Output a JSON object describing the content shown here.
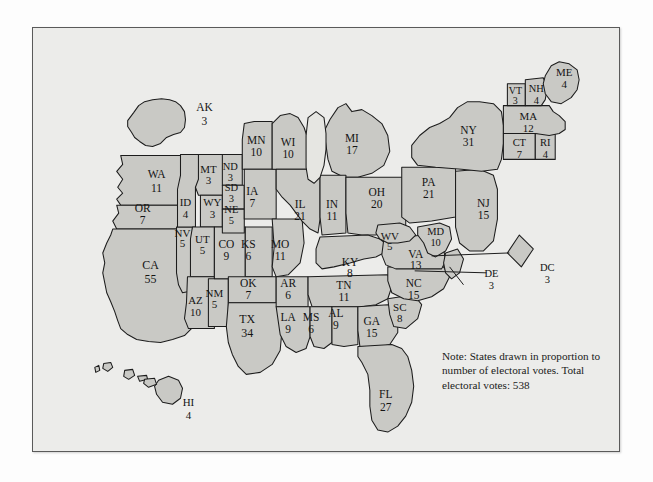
{
  "figure": {
    "kind": "electoral-vote-cartogram",
    "note": "Note: States drawn in proportion to number of electoral votes.  Total electoral votes: 538",
    "colors": {
      "page_background": "#fdfdfd",
      "frame_background": "#ececea",
      "frame_border": "#5a5a5a",
      "state_fill": "#c9c9c5",
      "state_stroke": "#1c1c1c",
      "lake_fill": "#e6e6e2",
      "text": "#141414"
    }
  },
  "chart_data": {
    "type": "map",
    "title": "",
    "subtitle": "",
    "xlabel": "",
    "ylabel": "",
    "annotations": [
      "Note: States drawn in proportion to number of electoral votes.  Total electoral votes: 538"
    ],
    "legend": [],
    "total_label": "Total electoral votes: 538",
    "total_value": 538,
    "value_name": "electoral votes",
    "categories": [
      "AK",
      "WA",
      "OR",
      "CA",
      "NV",
      "ID",
      "MT",
      "WY",
      "UT",
      "AZ",
      "NM",
      "CO",
      "ND",
      "SD",
      "NE",
      "KS",
      "OK",
      "TX",
      "MN",
      "IA",
      "MO",
      "AR",
      "LA",
      "WI",
      "IL",
      "MI",
      "IN",
      "OH",
      "KY",
      "TN",
      "MS",
      "AL",
      "GA",
      "FL",
      "SC",
      "NC",
      "VA",
      "WV",
      "MD",
      "DE",
      "DC",
      "PA",
      "NJ",
      "NY",
      "CT",
      "RI",
      "MA",
      "VT",
      "NH",
      "ME",
      "HI"
    ],
    "values": [
      3,
      11,
      7,
      55,
      5,
      4,
      3,
      3,
      5,
      10,
      5,
      9,
      3,
      3,
      5,
      6,
      7,
      34,
      10,
      7,
      11,
      6,
      9,
      10,
      21,
      17,
      11,
      20,
      8,
      11,
      6,
      9,
      15,
      27,
      8,
      15,
      13,
      5,
      10,
      3,
      3,
      21,
      15,
      31,
      7,
      4,
      12,
      3,
      4,
      4,
      4
    ]
  },
  "states": [
    {
      "id": "AK",
      "abbr": "AK",
      "votes": "3",
      "lx": 172,
      "ly": 81,
      "vy": 95,
      "fs": 11.5,
      "d": "M 95 93 L 101 85 L 106 78 L 112 74 L 120 72 L 129 71 L 137 72 L 143 74 L 148 78 L 152 84 L 153 92 L 152 100 L 148 105 L 141 107 L 134 110 L 128 116 L 120 119 L 113 118 L 107 114 L 102 110 L 99 105 L 95 99 Z"
    },
    {
      "id": "WA",
      "abbr": "WA",
      "votes": "11",
      "lx": 124,
      "ly": 148,
      "vy": 162,
      "fs": 11.5,
      "d": "M 88 128 L 161 128 L 161 178 L 88 178 L 84 172 L 90 166 L 85 160 L 90 152 L 84 144 L 90 137 Z"
    },
    {
      "id": "OR",
      "abbr": "OR",
      "votes": "7",
      "lx": 110,
      "ly": 182,
      "vy": 194,
      "fs": 11.5,
      "d": "M 84 178 L 161 178 L 161 202 L 84 202 L 80 194 L 86 186 Z"
    },
    {
      "id": "CA",
      "abbr": "CA",
      "votes": "55",
      "lx": 118,
      "ly": 239,
      "vy": 253,
      "fs": 12,
      "d": "M 80 202 L 161 202 L 161 300 L 152 309 L 140 313 L 128 316 L 116 315 L 104 313 L 95 308 L 88 302 L 85 294 L 82 285 L 78 275 L 74 266 L 72 256 L 70 246 L 72 236 L 70 226 L 74 216 L 78 208 Z"
    },
    {
      "id": "NV",
      "abbr": "NV",
      "votes": "5",
      "lx": 150,
      "ly": 207,
      "vy": 218,
      "fs": 11,
      "d": "M 144 200 L 160 200 L 160 264 L 150 266 L 146 258 L 144 246 Z"
    },
    {
      "id": "ID",
      "abbr": "ID",
      "votes": "4",
      "lx": 153,
      "ly": 176,
      "vy": 188,
      "fs": 11,
      "d": "M 148 127 L 168 127 L 168 155 L 163 160 L 163 200 L 145 200 L 145 162 L 148 148 Z"
    },
    {
      "id": "MT",
      "abbr": "MT",
      "votes": "3",
      "lx": 176,
      "ly": 143,
      "vy": 154,
      "fs": 11,
      "d": "M 166 127 L 192 127 L 192 168 L 166 168 L 163 160 L 166 152 Z"
    },
    {
      "id": "WY",
      "abbr": "WY",
      "votes": "3",
      "lx": 180,
      "ly": 176,
      "vy": 188,
      "fs": 11,
      "d": "M 168 168 L 190 168 L 190 200 L 168 200 Z"
    },
    {
      "id": "UT",
      "abbr": "UT",
      "votes": "5",
      "lx": 170,
      "ly": 213,
      "vy": 225,
      "fs": 11,
      "d": "M 160 200 L 182 200 L 182 250 L 158 250 L 158 212 Z"
    },
    {
      "id": "AZ",
      "abbr": "AZ",
      "votes": "10",
      "lx": 163,
      "ly": 275,
      "vy": 287,
      "fs": 11,
      "d": "M 155 250 L 182 250 L 182 302 L 156 302 L 152 292 L 154 276 Z"
    },
    {
      "id": "NM",
      "abbr": "NM",
      "votes": "5",
      "lx": 182,
      "ly": 268,
      "vy": 279,
      "fs": 11,
      "d": "M 176 252 L 196 252 L 196 300 L 176 300 Z"
    },
    {
      "id": "CO",
      "abbr": "CO",
      "votes": "9",
      "lx": 194,
      "ly": 218,
      "vy": 230,
      "fs": 11.5,
      "d": "M 182 200 L 213 200 L 213 252 L 182 252 Z"
    },
    {
      "id": "ND",
      "abbr": "ND",
      "votes": "3",
      "lx": 198,
      "ly": 140,
      "vy": 151,
      "fs": 10.5,
      "d": "M 190 127 L 210 127 L 210 158 L 190 158 Z"
    },
    {
      "id": "SD",
      "abbr": "SD",
      "votes": "3",
      "lx": 199,
      "ly": 161,
      "vy": 172,
      "fs": 10.5,
      "d": "M 190 158 L 212 158 L 212 182 L 190 182 Z"
    },
    {
      "id": "NE",
      "abbr": "NE",
      "votes": "5",
      "lx": 199,
      "ly": 183,
      "vy": 195,
      "fs": 10.5,
      "d": "M 190 182 L 212 182 L 212 206 L 190 206 Z"
    },
    {
      "id": "KS",
      "abbr": "KS",
      "votes": "6",
      "lx": 216,
      "ly": 218,
      "vy": 230,
      "fs": 11.5,
      "d": "M 213 200 L 240 200 L 240 250 L 213 250 Z"
    },
    {
      "id": "OK",
      "abbr": "OK",
      "votes": "7",
      "lx": 216,
      "ly": 258,
      "vy": 270,
      "fs": 11.5,
      "d": "M 196 250 L 244 250 L 244 276 L 196 276 Z"
    },
    {
      "id": "TX",
      "abbr": "TX",
      "votes": "34",
      "lx": 215,
      "ly": 294,
      "vy": 308,
      "fs": 12,
      "d": "M 196 276 L 248 276 L 250 302 L 248 324 L 240 338 L 228 346 L 214 348 L 206 340 L 200 328 L 196 316 L 194 300 Z"
    },
    {
      "id": "MN",
      "abbr": "MN",
      "votes": "10",
      "lx": 224,
      "ly": 114,
      "vy": 126,
      "fs": 11.5,
      "d": "M 210 112 L 212 96 L 222 94 L 240 94 L 240 142 L 210 142 L 210 127 Z"
    },
    {
      "id": "IA",
      "abbr": "IA",
      "votes": "7",
      "lx": 220,
      "ly": 165,
      "vy": 177,
      "fs": 11.5,
      "d": "M 212 142 L 244 142 L 244 192 L 212 192 Z"
    },
    {
      "id": "MO",
      "abbr": "MO",
      "votes": "11",
      "lx": 248,
      "ly": 218,
      "vy": 230,
      "fs": 11.5,
      "d": "M 240 192 L 270 192 L 272 216 L 268 236 L 256 248 L 244 250 L 240 240 L 242 220 Z"
    },
    {
      "id": "AR",
      "abbr": "AR",
      "votes": "6",
      "lx": 256,
      "ly": 258,
      "vy": 270,
      "fs": 11.5,
      "d": "M 244 250 L 276 250 L 276 280 L 244 280 Z"
    },
    {
      "id": "LA",
      "abbr": "LA",
      "votes": "9",
      "lx": 256,
      "ly": 292,
      "vy": 304,
      "fs": 11.5,
      "d": "M 244 280 L 278 280 L 278 310 L 274 322 L 264 326 L 254 320 L 248 308 L 246 294 Z"
    },
    {
      "id": "WI",
      "abbr": "WI",
      "votes": "10",
      "lx": 256,
      "ly": 116,
      "vy": 128,
      "fs": 11.5,
      "d": "M 240 96 L 248 88 L 258 86 L 266 90 L 272 100 L 276 112 L 276 142 L 240 142 Z"
    },
    {
      "id": "IL",
      "abbr": "IL",
      "votes": "21",
      "lx": 268,
      "ly": 178,
      "vy": 190,
      "fs": 11.5,
      "d": "M 244 142 L 288 142 L 288 192 L 286 206 L 278 202 L 270 194 L 264 186 L 258 178 L 250 170 L 244 162 Z"
    },
    {
      "id": "MI",
      "abbr": "MI",
      "votes": "17",
      "lx": 320,
      "ly": 112,
      "vy": 124,
      "fs": 11.5,
      "d": "M 298 92 L 306 80 L 314 76 L 320 84 L 330 82 L 340 88 L 350 96 L 356 108 L 358 124 L 352 138 L 340 146 L 326 150 L 312 150 L 300 144 L 296 132 L 294 118 L 292 104 Z"
    },
    {
      "id": "IN",
      "abbr": "IN",
      "votes": "11",
      "lx": 300,
      "ly": 178,
      "vy": 190,
      "fs": 11.5,
      "d": "M 288 148 L 314 148 L 314 206 L 290 208 L 288 190 Z"
    },
    {
      "id": "OH",
      "abbr": "OH",
      "votes": "20",
      "lx": 345,
      "ly": 166,
      "vy": 178,
      "fs": 11.5,
      "d": "M 314 150 L 374 150 L 374 200 L 356 202 L 344 208 L 330 208 L 316 206 L 314 186 Z"
    },
    {
      "id": "KY",
      "abbr": "KY",
      "votes": "8",
      "lx": 318,
      "ly": 237,
      "vy": 248,
      "fs": 11.5,
      "d": "M 288 210 L 336 208 L 348 212 L 356 218 L 352 226 L 344 230 L 332 232 L 318 236 L 302 240 L 290 242 L 284 236 L 284 222 Z"
    },
    {
      "id": "TN",
      "abbr": "TN",
      "votes": "11",
      "lx": 312,
      "ly": 260,
      "vy": 272,
      "fs": 11.5,
      "d": "M 276 250 L 356 248 L 360 260 L 356 272 L 344 278 L 330 280 L 314 280 L 296 280 L 280 280 L 276 268 Z"
    },
    {
      "id": "MS",
      "abbr": "MS",
      "votes": "6",
      "lx": 279,
      "ly": 292,
      "vy": 304,
      "fs": 11.5,
      "d": "M 278 280 L 300 280 L 300 316 L 292 322 L 282 320 L 278 310 Z"
    },
    {
      "id": "AL",
      "abbr": "AL",
      "votes": "9",
      "lx": 304,
      "ly": 288,
      "vy": 300,
      "fs": 11.5,
      "d": "M 300 280 L 326 280 L 326 318 L 312 320 L 300 318 Z"
    },
    {
      "id": "GA",
      "abbr": "GA",
      "votes": "15",
      "lx": 340,
      "ly": 296,
      "vy": 308,
      "fs": 11.5,
      "d": "M 326 280 L 356 278 L 366 286 L 366 306 L 358 318 L 342 322 L 328 320 L 326 304 Z"
    },
    {
      "id": "FL",
      "abbr": "FL",
      "votes": "27",
      "lx": 354,
      "ly": 369,
      "vy": 382,
      "fs": 11.5,
      "d": "M 326 320 L 360 318 L 370 322 L 376 330 L 380 344 L 382 360 L 380 376 L 374 390 L 366 400 L 356 406 L 346 404 L 340 394 L 338 380 L 338 364 L 336 348 L 330 336 L 326 330 Z"
    },
    {
      "id": "SC",
      "abbr": "SC",
      "votes": "8",
      "lx": 368,
      "ly": 282,
      "vy": 293,
      "fs": 11,
      "d": "M 356 272 L 382 268 L 390 278 L 386 292 L 374 302 L 362 300 L 358 288 Z"
    },
    {
      "id": "NC",
      "abbr": "NC",
      "votes": "15",
      "lx": 382,
      "ly": 258,
      "vy": 270,
      "fs": 11.5,
      "d": "M 356 240 L 412 240 L 418 250 L 412 262 L 400 270 L 386 274 L 372 272 L 360 266 L 356 254 Z"
    },
    {
      "id": "VA",
      "abbr": "VA",
      "votes": "13",
      "lx": 384,
      "ly": 228,
      "vy": 240,
      "fs": 11.5,
      "d": "M 352 212 L 392 208 L 406 212 L 412 222 L 414 234 L 410 242 L 396 242 L 380 242 L 364 242 L 354 238 L 350 228 Z"
    },
    {
      "id": "WV",
      "abbr": "WV",
      "votes": "5",
      "lx": 358,
      "ly": 210,
      "vy": 221,
      "fs": 11,
      "d": "M 346 198 L 368 196 L 378 200 L 384 208 L 378 214 L 366 216 L 356 216 L 348 212 L 344 206 Z"
    },
    {
      "id": "MD",
      "abbr": "MD",
      "votes": "10",
      "lx": 404,
      "ly": 206,
      "vy": 217,
      "fs": 10.5,
      "d": "M 386 200 L 408 196 L 418 200 L 420 212 L 414 224 L 404 230 L 396 226 L 392 216 L 386 208 Z"
    },
    {
      "id": "DE",
      "abbr": "DE",
      "votes": "3",
      "lx": 460,
      "ly": 248,
      "vy": 260,
      "fs": 10.5,
      "d": "M 414 226 L 426 222 L 432 232 L 428 246 L 420 252 L 414 246 L 412 236 Z"
    },
    {
      "id": "DC",
      "abbr": "DC",
      "votes": "3",
      "lx": 516,
      "ly": 242,
      "vy": 254,
      "fs": 10.5,
      "d": "M 488 208 L 502 222 L 490 240 L 476 226 Z"
    },
    {
      "id": "PA",
      "abbr": "PA",
      "votes": "21",
      "lx": 397,
      "ly": 156,
      "vy": 168,
      "fs": 11.5,
      "d": "M 370 140 L 424 140 L 424 190 L 400 194 L 378 196 L 370 190 Z"
    },
    {
      "id": "NJ",
      "abbr": "NJ",
      "votes": "15",
      "lx": 452,
      "ly": 177,
      "vy": 189,
      "fs": 11.5,
      "d": "M 424 144 L 448 142 L 462 148 L 466 162 L 466 192 L 462 214 L 452 224 L 438 224 L 428 216 L 424 200 L 424 172 Z"
    },
    {
      "id": "NY",
      "abbr": "NY",
      "votes": "31",
      "lx": 437,
      "ly": 104,
      "vy": 116,
      "fs": 11.5,
      "d": "M 380 118 L 388 108 L 398 100 L 408 96 L 418 90 L 426 80 L 436 74 L 448 74 L 462 76 L 470 84 L 472 98 L 472 116 L 470 132 L 466 142 L 450 144 L 430 142 L 404 140 L 386 138 L 380 130 Z"
    },
    {
      "id": "CT",
      "abbr": "CT",
      "votes": "7",
      "lx": 488,
      "ly": 116,
      "vy": 128,
      "fs": 10.5,
      "d": "M 472 106 L 504 106 L 504 132 L 472 132 Z"
    },
    {
      "id": "RI",
      "abbr": "RI",
      "votes": "4",
      "lx": 514,
      "ly": 116,
      "vy": 128,
      "fs": 10.5,
      "d": "M 504 106 L 524 106 L 524 132 L 504 132 Z"
    },
    {
      "id": "MA",
      "abbr": "MA",
      "votes": "12",
      "lx": 497,
      "ly": 90,
      "vy": 102,
      "fs": 11,
      "d": "M 472 78 L 518 78 L 522 84 L 528 88 L 534 94 L 534 102 L 528 106 L 518 108 L 504 106 L 490 106 L 472 106 Z"
    },
    {
      "id": "VT",
      "abbr": "VT",
      "votes": "3",
      "lx": 484,
      "ly": 64,
      "vy": 74,
      "fs": 10,
      "d": "M 476 56 L 494 56 L 494 78 L 476 78 Z"
    },
    {
      "id": "NH",
      "abbr": "NH",
      "votes": "4",
      "lx": 505,
      "ly": 62,
      "vy": 74,
      "fs": 10.5,
      "d": "M 494 52 L 512 50 L 516 60 L 514 72 L 510 78 L 494 78 Z"
    },
    {
      "id": "ME",
      "abbr": "ME",
      "votes": "4",
      "lx": 533,
      "ly": 46,
      "vy": 58,
      "fs": 11,
      "d": "M 514 48 L 520 38 L 528 34 L 538 36 L 546 42 L 548 52 L 546 62 L 540 70 L 530 76 L 520 74 L 514 66 L 512 56 Z"
    },
    {
      "id": "HI",
      "abbr": "HI",
      "votes": "4",
      "lx": 156,
      "ly": 377,
      "vy": 390,
      "fs": 11,
      "d": "M 126 354 L 136 350 L 146 354 L 150 362 L 148 372 L 140 378 L 130 376 L 124 368 L 122 360 Z"
    }
  ],
  "lakes": [
    {
      "id": "lake-michigan",
      "d": "M 276 90 L 284 84 L 292 90 L 294 106 L 294 122 L 292 138 L 288 150 L 282 156 L 276 152 L 274 140 L 274 124 L 274 108 Z"
    }
  ],
  "hawaii_islets": [
    {
      "id": "islet-niihau",
      "d": "M 62 341 L 66 339 L 67 344 L 63 346 Z"
    },
    {
      "id": "islet-kauai",
      "d": "M 71 337 L 78 336 L 80 341 L 75 345 L 70 342 Z"
    },
    {
      "id": "islet-oahu",
      "d": "M 92 344 L 100 343 L 102 349 L 96 353 L 91 350 Z"
    },
    {
      "id": "islet-molokai",
      "d": "M 105 350 L 114 349 L 115 353 L 107 355 Z"
    },
    {
      "id": "islet-maui",
      "d": "M 112 353 L 122 352 L 124 358 L 116 361 L 111 357 Z"
    }
  ],
  "leaders": [
    {
      "id": "leader-de",
      "d": "M 418 240 L 432 258"
    },
    {
      "id": "leader-dc",
      "d": "M 400 229 L 478 226"
    },
    {
      "id": "leader-dc-2",
      "d": "M 383 244 L 455 246"
    }
  ]
}
